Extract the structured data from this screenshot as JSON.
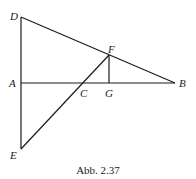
{
  "figure": {
    "caption": "Abb. 2.37",
    "points": {
      "A": {
        "label": "A",
        "x": 21,
        "y": 83
      },
      "B": {
        "label": "B",
        "x": 175,
        "y": 83
      },
      "C": {
        "label": "C",
        "x": 80,
        "y": 83
      },
      "D": {
        "label": "D",
        "x": 21,
        "y": 17
      },
      "E": {
        "label": "E",
        "x": 21,
        "y": 149
      },
      "F": {
        "label": "F",
        "x": 109,
        "y": 55
      },
      "G": {
        "label": "G",
        "x": 109,
        "y": 83
      }
    },
    "segments": [
      "DE",
      "DB",
      "AB",
      "EF",
      "FG"
    ]
  }
}
